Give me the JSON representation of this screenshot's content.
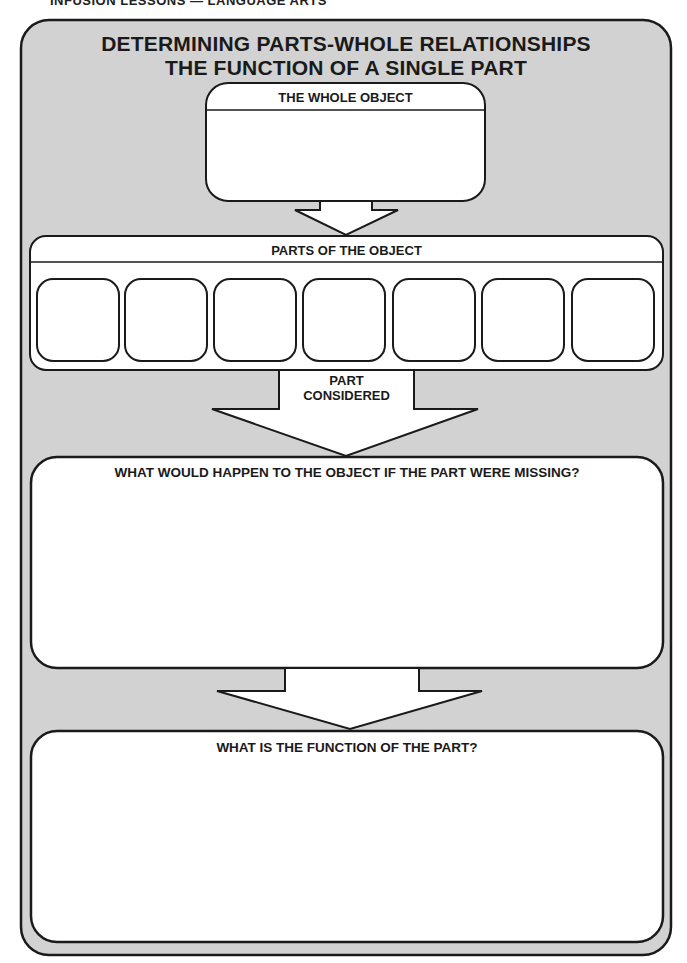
{
  "running_head": "INFUSION LESSONS — LANGUAGE ARTS",
  "title": {
    "line1": "DETERMINING PARTS-WHOLE RELATIONSHIPS",
    "line2": "THE FUNCTION OF A SINGLE PART"
  },
  "whole_object": {
    "label": "THE WHOLE OBJECT",
    "value": ""
  },
  "parts": {
    "label": "PARTS OF THE OBJECT",
    "slots": [
      "",
      "",
      "",
      "",
      "",
      "",
      ""
    ]
  },
  "part_considered": {
    "line1": "PART",
    "line2": "CONSIDERED",
    "value": ""
  },
  "missing": {
    "label": "WHAT WOULD HAPPEN TO THE OBJECT IF THE PART WERE MISSING?",
    "value": ""
  },
  "function": {
    "label": "WHAT IS THE FUNCTION OF THE PART?",
    "value": ""
  },
  "colors": {
    "frame_fill": "#d2d2d2",
    "box_fill": "#ffffff",
    "stroke": "#1a1a1a"
  }
}
